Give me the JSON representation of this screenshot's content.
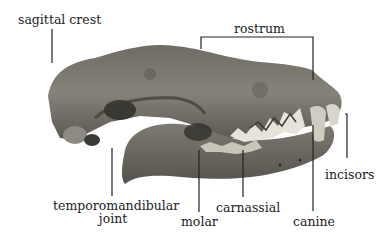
{
  "diagram": {
    "labels": {
      "sagittal_crest": "sagittal crest",
      "rostrum": "rostrum",
      "incisors": "incisors",
      "tmj_line1": "temporomandibular",
      "tmj_line2": "joint",
      "molar": "molar",
      "carnassial": "carnassial",
      "canine": "canine"
    },
    "colors": {
      "bone_dark": "#4a4a44",
      "bone_mid": "#7a7870",
      "bone_light": "#a8a59c",
      "tooth": "#d8d5cc",
      "line": "#222222"
    }
  }
}
